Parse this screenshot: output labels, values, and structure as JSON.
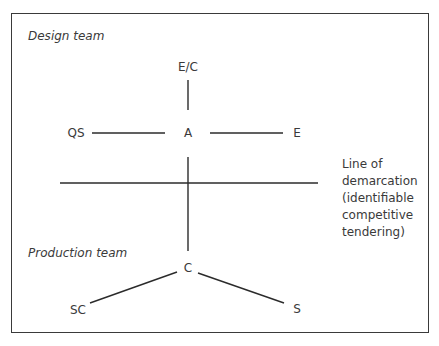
{
  "diagram": {
    "sections": {
      "design_team": "Design team",
      "production_team": "Production team"
    },
    "nodes": {
      "ec": "E/C",
      "qs": "QS",
      "a": "A",
      "e": "E",
      "c": "C",
      "sc": "SC",
      "s": "S"
    },
    "demarcation_note": [
      "Line of",
      "demarcation",
      "(identifiable",
      "competitive",
      "tendering)"
    ],
    "edges": [
      {
        "from": "E/C",
        "to": "A"
      },
      {
        "from": "QS",
        "to": "A"
      },
      {
        "from": "A",
        "to": "E"
      },
      {
        "from": "A",
        "to": "C"
      },
      {
        "from": "C",
        "to": "SC"
      },
      {
        "from": "C",
        "to": "S"
      }
    ],
    "line_color": "#2b2b2b"
  }
}
